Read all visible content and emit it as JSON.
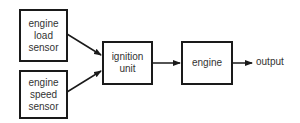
{
  "diagram": {
    "type": "block-diagram",
    "nodes": {
      "load_sensor": {
        "lines": [
          "engine",
          "load",
          "sensor"
        ]
      },
      "speed_sensor": {
        "lines": [
          "engine",
          "speed",
          "sensor"
        ]
      },
      "ignition_unit": {
        "lines": [
          "ignition",
          "unit"
        ]
      },
      "engine": {
        "lines": [
          "engine"
        ]
      }
    },
    "output_label": "output",
    "edges": [
      {
        "from": "engine load sensor",
        "to": "ignition unit"
      },
      {
        "from": "engine speed sensor",
        "to": "ignition unit"
      },
      {
        "from": "ignition unit",
        "to": "engine"
      },
      {
        "from": "engine",
        "to": "output"
      }
    ]
  }
}
